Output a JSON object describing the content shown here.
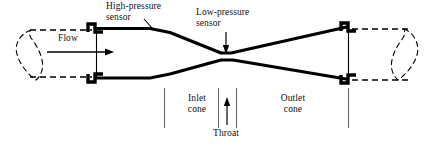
{
  "figure": {
    "type": "engineering-cross-section-diagram",
    "background_color": "#ffffff",
    "line_color": "#000000",
    "divider_color": "#6b6b6b"
  },
  "labels": {
    "high_pressure_sensor": "High-pressure\nsensor",
    "low_pressure_sensor": "Low-pressure\nsensor",
    "flow": "Flow",
    "inlet_cone": "Inlet\ncone",
    "outlet_cone": "Outlet\ncone",
    "throat": "Throat"
  },
  "icons": {
    "flow_arrow": "arrow-right-icon",
    "high_pressure_leader": "leader-line-icon",
    "low_pressure_arrow": "arrow-down-icon",
    "throat_arrow": "arrow-up-icon",
    "left_break": "pipe-break-symbol-icon",
    "right_break": "pipe-break-symbol-icon",
    "left_flange": "flange-icon",
    "right_flange": "flange-icon"
  },
  "geometry": {
    "top_wall": "M 96,28 L 150,28 L 168,32 L 222,53 L 228,53 L 348,27",
    "bottom_wall": "M 96,78 L 150,78 L 168,74 L 222,60 L 232,60 L 348,79",
    "inlet_divider_x": 164,
    "throat_divider_left_x": 218,
    "throat_divider_right_x": 236,
    "outlet_divider_x": 348,
    "divider_top_y": 88,
    "divider_bottom_y": 128,
    "left_flange_x": 96,
    "right_flange_x": 348,
    "flow_arrow": {
      "x1": 47,
      "y1": 52,
      "x2": 113,
      "y2": 52
    }
  }
}
